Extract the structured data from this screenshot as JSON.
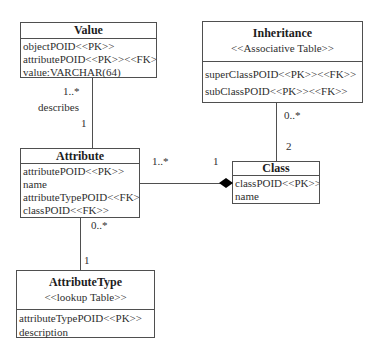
{
  "classes": {
    "value": {
      "title": "Value",
      "attributes": [
        "objectPOID<<PK>>",
        "attributePOID<<PK>><<FK>>",
        "value:VARCHAR(64)"
      ]
    },
    "inheritance": {
      "title": "Inheritance",
      "stereotype": "<<Associative Table>>",
      "attributes": [
        "superClassPOID<<PK>><<FK>>",
        "subClassPOID<<PK>><<FK>>"
      ]
    },
    "attribute": {
      "title": "Attribute",
      "attributes": [
        "attributePOID<<PK>>",
        "name",
        "attributeTypePOID<<FK>>",
        "classPOID<<FK>>"
      ]
    },
    "class": {
      "title": "Class",
      "attributes": [
        "classPOID<<PK>>",
        "name"
      ]
    },
    "attribute_type": {
      "title": "AttributeType",
      "stereotype": "<<lookup Table>>",
      "attributes": [
        "attributeTypePOID<<PK>>",
        "description"
      ]
    }
  },
  "relationships": {
    "value_describes_attribute": {
      "mult_near_value": "1..*",
      "label": "describes",
      "mult_near_attribute": "1"
    },
    "attribute_class": {
      "mult_near_attribute": "1..*",
      "mult_near_class": "1",
      "aggregation": "composition-diamond-at-class"
    },
    "inheritance_class": {
      "mult_near_inheritance": "0..*",
      "mult_near_class": "2"
    },
    "attribute_attributetype": {
      "mult_near_attribute": "0..*",
      "mult_near_attributetype": "1"
    }
  },
  "colors": {
    "background": "#ffffff",
    "box_border": "#4f4f4f",
    "text": "#2f2f2f",
    "composition_diamond": "#000000"
  }
}
